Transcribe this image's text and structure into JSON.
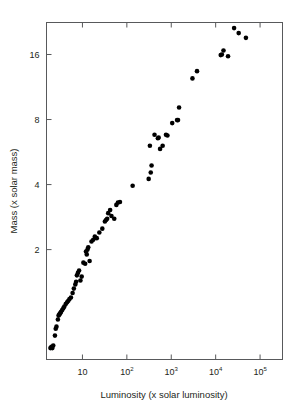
{
  "figure": {
    "title": "",
    "background_color": "#ffffff",
    "frame_color": "#58595b",
    "point_color": "#000000"
  },
  "axes": {
    "x_title": "Luminosity (x solar luminosity)",
    "y_title": "Mass (x solar mass)",
    "x_ticks": [
      {
        "label": "10",
        "mantissa": "10",
        "exponent": "",
        "value": 10
      },
      {
        "label": "10²",
        "mantissa": "10",
        "exponent": "2",
        "value": 100
      },
      {
        "label": "10³",
        "mantissa": "10",
        "exponent": "3",
        "value": 1000
      },
      {
        "label": "10⁴",
        "mantissa": "10",
        "exponent": "4",
        "value": 10000
      },
      {
        "label": "10⁵",
        "mantissa": "10",
        "exponent": "5",
        "value": 100000
      }
    ],
    "y_ticks": [
      {
        "label": "2",
        "value": 2
      },
      {
        "label": "4",
        "value": 4
      },
      {
        "label": "8",
        "value": 8
      },
      {
        "label": "16",
        "value": 16
      }
    ]
  },
  "chart_data": {
    "type": "scatter",
    "title": "",
    "xlabel": "Luminosity (x solar luminosity)",
    "ylabel": "Mass (x solar mass)",
    "xscale": "log",
    "yscale": "log",
    "xlim": [
      1.55,
      320000
    ],
    "ylim": [
      0.62,
      22.5
    ],
    "grid": false,
    "legend": null,
    "marker": "filled-circle",
    "marker_size_px": 4.6,
    "series": [
      {
        "name": "stars",
        "points": [
          [
            1.9,
            0.7
          ],
          [
            2.0,
            0.71
          ],
          [
            2.1,
            0.7
          ],
          [
            2.2,
            0.72
          ],
          [
            2.4,
            0.8
          ],
          [
            2.5,
            0.86
          ],
          [
            2.6,
            0.88
          ],
          [
            2.8,
            0.95
          ],
          [
            2.9,
            0.99
          ],
          [
            3.0,
            1.0
          ],
          [
            3.1,
            1.01
          ],
          [
            3.2,
            1.02
          ],
          [
            3.3,
            1.03
          ],
          [
            3.5,
            1.05
          ],
          [
            3.7,
            1.07
          ],
          [
            3.9,
            1.09
          ],
          [
            4.2,
            1.12
          ],
          [
            4.5,
            1.14
          ],
          [
            4.8,
            1.16
          ],
          [
            5.1,
            1.18
          ],
          [
            5.5,
            1.2
          ],
          [
            6.0,
            1.26
          ],
          [
            6.4,
            1.32
          ],
          [
            6.9,
            1.38
          ],
          [
            7.2,
            1.42
          ],
          [
            7.5,
            1.52
          ],
          [
            7.9,
            1.56
          ],
          [
            8.4,
            1.6
          ],
          [
            9.0,
            1.44
          ],
          [
            9.6,
            1.5
          ],
          [
            10.5,
            1.74
          ],
          [
            11.5,
            1.72
          ],
          [
            12.0,
            1.96
          ],
          [
            12.5,
            1.9
          ],
          [
            13.0,
            2.0
          ],
          [
            13.5,
            2.05
          ],
          [
            14.5,
            1.77
          ],
          [
            16.0,
            2.18
          ],
          [
            17.5,
            2.22
          ],
          [
            19.0,
            2.3
          ],
          [
            21.0,
            2.26
          ],
          [
            24.0,
            2.4
          ],
          [
            28.0,
            2.5
          ],
          [
            32.0,
            2.7
          ],
          [
            34.0,
            2.74
          ],
          [
            36.0,
            2.78
          ],
          [
            38.0,
            2.95
          ],
          [
            42.0,
            3.05
          ],
          [
            45.0,
            2.86
          ],
          [
            52.0,
            2.78
          ],
          [
            58.0,
            3.22
          ],
          [
            63.0,
            3.3
          ],
          [
            70.0,
            3.32
          ],
          [
            135.0,
            3.95
          ],
          [
            310.0,
            4.25
          ],
          [
            330.0,
            6.05
          ],
          [
            345.0,
            4.55
          ],
          [
            360.0,
            4.9
          ],
          [
            420.0,
            6.8
          ],
          [
            500.0,
            6.55
          ],
          [
            520.0,
            6.6
          ],
          [
            560.0,
            5.85
          ],
          [
            640.0,
            6.05
          ],
          [
            760.0,
            6.8
          ],
          [
            820.0,
            6.75
          ],
          [
            1050.0,
            7.7
          ],
          [
            1350.0,
            7.95
          ],
          [
            1420.0,
            7.95
          ],
          [
            1500.0,
            9.1
          ],
          [
            3000.0,
            12.4
          ],
          [
            3800.0,
            13.4
          ],
          [
            13000.0,
            15.9
          ],
          [
            13800.0,
            16.0
          ],
          [
            15000.0,
            16.7
          ],
          [
            19000.0,
            15.7
          ],
          [
            26000.0,
            21.2
          ],
          [
            33000.0,
            20.1
          ],
          [
            48000.0,
            19.1
          ]
        ]
      }
    ]
  }
}
